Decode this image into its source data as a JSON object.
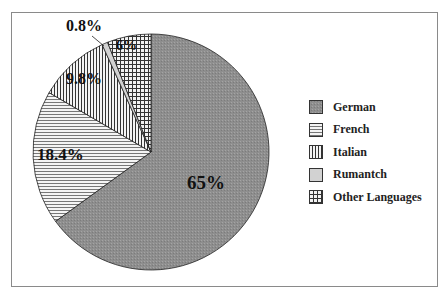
{
  "chart_data": {
    "type": "pie",
    "title": "",
    "categories": [
      "German",
      "French",
      "Italian",
      "Rumantch",
      "Other Languages"
    ],
    "values": [
      65,
      18.4,
      9.8,
      0.8,
      6
    ],
    "labels": [
      "65%",
      "18.4%",
      "9.8%",
      "0.8%",
      "6%"
    ],
    "patterns": [
      "gray-stipple",
      "horizontal-lines",
      "vertical-lines",
      "light-gray",
      "crosshatch-grid"
    ],
    "legend_position": "right",
    "start_angle": "12 o'clock, clockwise"
  },
  "legend": {
    "items": [
      {
        "label": "German"
      },
      {
        "label": "French"
      },
      {
        "label": "Italian"
      },
      {
        "label": "Rumantch"
      },
      {
        "label": "Other Languages"
      }
    ]
  },
  "slice_labels": {
    "german": "65%",
    "french": "18.4%",
    "italian": "9.8%",
    "rumantch": "0.8%",
    "other": "6%"
  }
}
